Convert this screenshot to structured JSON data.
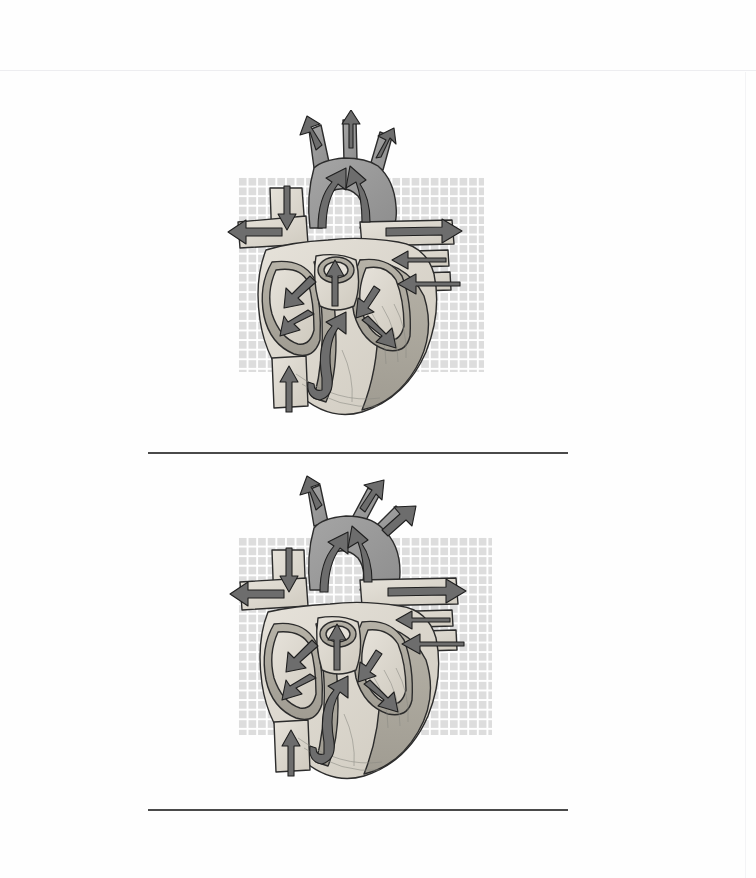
{
  "page": {
    "background_color": "#fefefe",
    "width": 756,
    "height": 878,
    "header_rule_color": "#ededf0"
  },
  "answer_lines": [
    {
      "name": "answer-line-1",
      "color": "#4a4a4a"
    },
    {
      "name": "answer-line-2",
      "color": "#4a4a4a"
    }
  ],
  "figures": [
    {
      "id": "figure-1",
      "caption": "",
      "label": "Heart cross-section with blood flow arrows (diagram 1)",
      "grid": {
        "cell_color": "#d8d8d8",
        "line_color": "#ffffff",
        "cell_size_px": 9.6
      },
      "illustration": {
        "name": "human-heart-cross-section",
        "style": "grayscale line art with flow arrows",
        "fill_light": "#dcd8cf",
        "fill_mid": "#b9b5ab",
        "fill_dark": "#9a9a9a",
        "outline": "#2c2c2c",
        "arrow_fill": "#6d6d6d",
        "arrow_outline": "#1f1f1f",
        "arrows": [
          {
            "name": "arrow-brachiocephalic-out",
            "direction": "up-left"
          },
          {
            "name": "arrow-left-common-carotid-out",
            "direction": "up"
          },
          {
            "name": "arrow-left-subclavian-out",
            "direction": "up-right"
          },
          {
            "name": "arrow-superior-vena-cava-in",
            "direction": "down"
          },
          {
            "name": "arrow-right-pulmonary-artery-out",
            "direction": "left"
          },
          {
            "name": "arrow-left-pulmonary-artery-out",
            "direction": "right"
          },
          {
            "name": "arrow-pulmonary-vein-upper-in",
            "direction": "left"
          },
          {
            "name": "arrow-pulmonary-vein-lower-in",
            "direction": "left"
          },
          {
            "name": "arrow-inferior-vena-cava-in",
            "direction": "up"
          },
          {
            "name": "arrow-right-atrium-to-right-ventricle",
            "direction": "down-left"
          },
          {
            "name": "arrow-right-ventricle-to-pulmonary-trunk",
            "direction": "up"
          },
          {
            "name": "arrow-left-atrium-to-left-ventricle",
            "direction": "down-right"
          },
          {
            "name": "arrow-left-ventricle-to-aorta",
            "direction": "up"
          },
          {
            "name": "arrow-aortic-arch-flow",
            "direction": "up"
          }
        ]
      }
    },
    {
      "id": "figure-2",
      "caption": "",
      "label": "Heart cross-section with blood flow arrows (diagram 2)",
      "grid": {
        "cell_color": "#d8d8d8",
        "line_color": "#ffffff",
        "cell_size_px": 9.6
      },
      "illustration": {
        "name": "human-heart-cross-section",
        "style": "grayscale line art with flow arrows",
        "fill_light": "#dcd8cf",
        "fill_mid": "#b9b5ab",
        "fill_dark": "#9a9a9a",
        "outline": "#2c2c2c",
        "arrow_fill": "#6d6d6d",
        "arrow_outline": "#1f1f1f",
        "arrows": [
          {
            "name": "arrow-brachiocephalic-out",
            "direction": "up-left"
          },
          {
            "name": "arrow-left-common-carotid-out",
            "direction": "up-right"
          },
          {
            "name": "arrow-left-subclavian-out",
            "direction": "up-right"
          },
          {
            "name": "arrow-superior-vena-cava-in",
            "direction": "down"
          },
          {
            "name": "arrow-right-pulmonary-artery-out",
            "direction": "left"
          },
          {
            "name": "arrow-left-pulmonary-artery-out",
            "direction": "right"
          },
          {
            "name": "arrow-pulmonary-vein-upper-in",
            "direction": "left"
          },
          {
            "name": "arrow-pulmonary-vein-lower-in",
            "direction": "left"
          },
          {
            "name": "arrow-inferior-vena-cava-in",
            "direction": "up"
          },
          {
            "name": "arrow-right-atrium-to-right-ventricle",
            "direction": "down-left"
          },
          {
            "name": "arrow-right-ventricle-to-pulmonary-trunk",
            "direction": "up"
          },
          {
            "name": "arrow-left-atrium-to-left-ventricle",
            "direction": "down-right"
          },
          {
            "name": "arrow-left-ventricle-to-aorta",
            "direction": "up"
          },
          {
            "name": "arrow-aortic-arch-flow",
            "direction": "up"
          }
        ]
      }
    }
  ]
}
